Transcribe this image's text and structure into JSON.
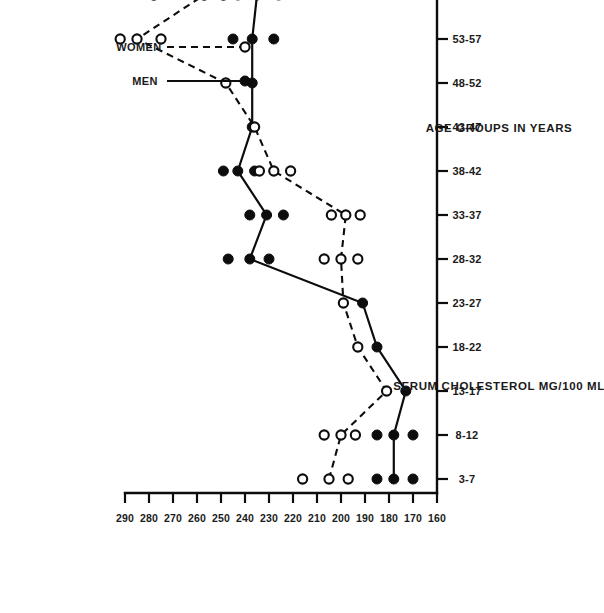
{
  "chart_data": {
    "type": "line",
    "title": "",
    "xlabel": "AGE GROUPS IN YEARS",
    "ylabel": "SERUM CHOLESTEROL MG/100 ML",
    "orientation": "page-rotated-90-ccw",
    "grid": false,
    "legend_position": "right-upper",
    "categories": [
      "3-7",
      "8-12",
      "13-17",
      "18-22",
      "23-27",
      "28-32",
      "33-37",
      "38-42",
      "43-47",
      "48-52",
      "53-57",
      "58-62",
      "63-67"
    ],
    "ylim": [
      160,
      290
    ],
    "yticks": [
      290,
      280,
      270,
      260,
      250,
      240,
      230,
      220,
      210,
      200,
      190,
      180,
      170,
      160
    ],
    "xtick_labels": [
      "3-7",
      "8-12",
      "13-17",
      "18-22",
      "23-27",
      "28-32",
      "33-37",
      "38-42",
      "43-47",
      "48-52",
      "53-57",
      "58-62",
      "63-67"
    ],
    "series": [
      {
        "name": "MEN",
        "marker": "filled-circle",
        "line": "solid",
        "values": [
          178,
          178,
          173,
          185,
          191,
          238,
          231,
          243,
          237,
          237,
          237,
          235,
          248
        ],
        "spread_low": [
          170,
          170,
          173,
          185,
          191,
          230,
          224,
          236,
          237,
          237,
          228,
          226,
          248
        ],
        "spread_high": [
          185,
          185,
          173,
          185,
          191,
          247,
          238,
          249,
          237,
          237,
          245,
          243,
          248
        ]
      },
      {
        "name": "WOMEN",
        "marker": "open-circle",
        "line": "dashed",
        "values": [
          205,
          200,
          181,
          193,
          199,
          200,
          198,
          228,
          236,
          248,
          285,
          257,
          258
        ],
        "spread_low": [
          197,
          194,
          181,
          193,
          199,
          193,
          192,
          221,
          236,
          248,
          275,
          249,
          258
        ],
        "spread_high": [
          216,
          207,
          181,
          193,
          199,
          207,
          204,
          234,
          236,
          248,
          292,
          278,
          258
        ]
      }
    ]
  },
  "axes": {
    "x_axis_title": "AGE GROUPS IN YEARS",
    "y_axis_title": "SERUM CHOLESTEROL MG/100 ML"
  },
  "legend": {
    "items": [
      {
        "label": "MEN",
        "style": "solid-line-filled-circle"
      },
      {
        "label": "WOMEN",
        "style": "dashed-line-open-circle"
      }
    ]
  }
}
